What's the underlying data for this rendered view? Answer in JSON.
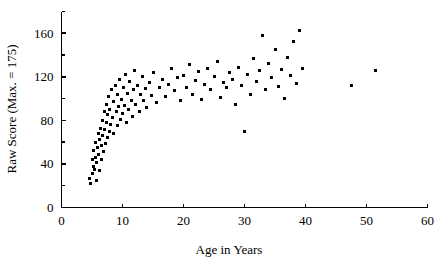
{
  "chart_data": {
    "type": "scatter",
    "title": "",
    "xlabel": "Age in Years",
    "ylabel": "Raw Score (Max. = 175)",
    "xlim": [
      0,
      60
    ],
    "ylim": [
      0,
      180
    ],
    "grid": false,
    "legend": null,
    "x_ticks_major": [
      0,
      10,
      20,
      30,
      40,
      50,
      60
    ],
    "x_tick_labels": [
      "0",
      "10",
      "20",
      "30",
      "40",
      "50",
      "60"
    ],
    "y_ticks_major": [
      0,
      40,
      80,
      120,
      160
    ],
    "y_tick_labels": [
      "0",
      "40",
      "80",
      "120",
      "160"
    ],
    "y_ticks_minor": [
      20,
      60,
      100,
      140,
      180
    ],
    "marker": "square",
    "marker_color": "#000000",
    "marker_size_px": 3,
    "points": [
      [
        4.6,
        27
      ],
      [
        4.8,
        22
      ],
      [
        5.0,
        31
      ],
      [
        5.1,
        44
      ],
      [
        5.2,
        38
      ],
      [
        5.3,
        52
      ],
      [
        5.4,
        35
      ],
      [
        5.5,
        46
      ],
      [
        5.6,
        60
      ],
      [
        5.7,
        25
      ],
      [
        5.8,
        41
      ],
      [
        5.9,
        55
      ],
      [
        6.0,
        68
      ],
      [
        6.1,
        49
      ],
      [
        6.2,
        34
      ],
      [
        6.3,
        62
      ],
      [
        6.4,
        73
      ],
      [
        6.5,
        57
      ],
      [
        6.6,
        44
      ],
      [
        6.7,
        80
      ],
      [
        6.8,
        66
      ],
      [
        6.9,
        51
      ],
      [
        7.0,
        88
      ],
      [
        7.1,
        72
      ],
      [
        7.2,
        59
      ],
      [
        7.3,
        95
      ],
      [
        7.4,
        78
      ],
      [
        7.5,
        64
      ],
      [
        7.6,
        85
      ],
      [
        7.7,
        102
      ],
      [
        7.8,
        70
      ],
      [
        7.9,
        90
      ],
      [
        8.0,
        76
      ],
      [
        8.2,
        108
      ],
      [
        8.4,
        83
      ],
      [
        8.5,
        97
      ],
      [
        8.6,
        68
      ],
      [
        8.8,
        112
      ],
      [
        9.0,
        88
      ],
      [
        9.1,
        104
      ],
      [
        9.2,
        75
      ],
      [
        9.4,
        93
      ],
      [
        9.5,
        118
      ],
      [
        9.6,
        81
      ],
      [
        9.8,
        99
      ],
      [
        10.0,
        86
      ],
      [
        10.2,
        110
      ],
      [
        10.4,
        94
      ],
      [
        10.5,
        122
      ],
      [
        10.6,
        78
      ],
      [
        10.8,
        105
      ],
      [
        11.0,
        90
      ],
      [
        11.2,
        116
      ],
      [
        11.4,
        98
      ],
      [
        11.6,
        84
      ],
      [
        11.8,
        108
      ],
      [
        12.0,
        126
      ],
      [
        12.2,
        95
      ],
      [
        12.5,
        112
      ],
      [
        12.8,
        88
      ],
      [
        13.0,
        104
      ],
      [
        13.2,
        120
      ],
      [
        13.5,
        98
      ],
      [
        13.8,
        109
      ],
      [
        14.0,
        92
      ],
      [
        14.5,
        115
      ],
      [
        14.8,
        103
      ],
      [
        15.0,
        124
      ],
      [
        15.5,
        96
      ],
      [
        16.0,
        110
      ],
      [
        16.5,
        118
      ],
      [
        17.0,
        102
      ],
      [
        17.5,
        113
      ],
      [
        18.0,
        128
      ],
      [
        18.5,
        107
      ],
      [
        19.0,
        119
      ],
      [
        19.5,
        98
      ],
      [
        20.0,
        121
      ],
      [
        20.5,
        110
      ],
      [
        21.0,
        131
      ],
      [
        21.5,
        104
      ],
      [
        22.0,
        117
      ],
      [
        22.5,
        125
      ],
      [
        23.0,
        99
      ],
      [
        23.5,
        113
      ],
      [
        24.0,
        128
      ],
      [
        24.5,
        108
      ],
      [
        25.0,
        120
      ],
      [
        25.5,
        134
      ],
      [
        26.0,
        101
      ],
      [
        26.5,
        115
      ],
      [
        27.0,
        110
      ],
      [
        27.5,
        124
      ],
      [
        28.0,
        118
      ],
      [
        28.5,
        95
      ],
      [
        29.0,
        129
      ],
      [
        29.5,
        112
      ],
      [
        30.0,
        70
      ],
      [
        30.5,
        122
      ],
      [
        31.0,
        104
      ],
      [
        31.5,
        137
      ],
      [
        32.0,
        116
      ],
      [
        32.5,
        126
      ],
      [
        33.0,
        158
      ],
      [
        33.5,
        108
      ],
      [
        34.0,
        132
      ],
      [
        34.5,
        119
      ],
      [
        35.0,
        145
      ],
      [
        35.5,
        111
      ],
      [
        36.0,
        127
      ],
      [
        36.5,
        100
      ],
      [
        37.0,
        138
      ],
      [
        37.5,
        121
      ],
      [
        38.0,
        152
      ],
      [
        38.5,
        114
      ],
      [
        39.0,
        163
      ],
      [
        39.5,
        128
      ],
      [
        47.5,
        112
      ],
      [
        51.5,
        126
      ]
    ]
  },
  "axes": {
    "x_axis_name": "x-axis",
    "y_axis_name": "y-axis"
  }
}
